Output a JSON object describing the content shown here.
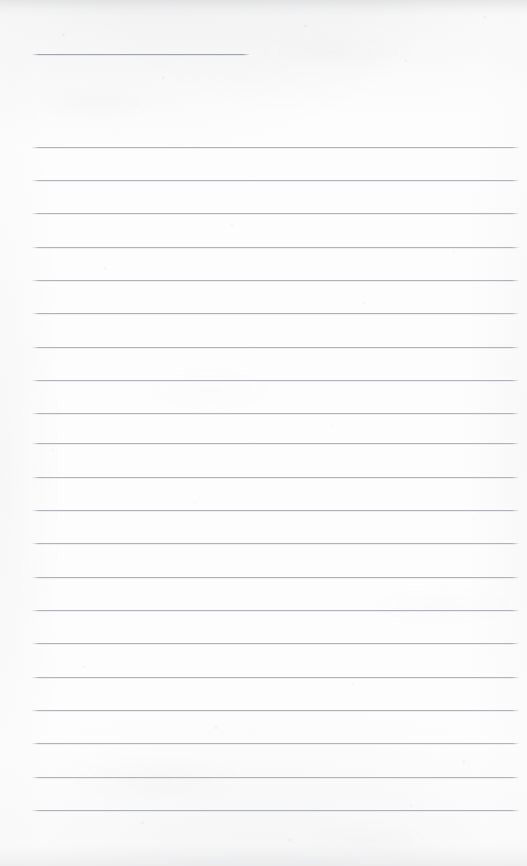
{
  "document": {
    "kind": "scanned-ruled-notepad-page",
    "description": "Blank lined notebook page, scanned",
    "page_width": 527,
    "page_height": 866,
    "paper_color": "#fdfdfd",
    "rule_color": "#acb0b5",
    "content_text": "",
    "handwriting_present": false
  },
  "layout": {
    "rule_left_x": 31,
    "rule_right_x": 520,
    "rule_thickness": 2,
    "line_spacing": 33.3,
    "title_rule_right_x": 251
  },
  "rules": [
    {
      "id": "title-rule",
      "label": "title-line",
      "y": 54,
      "x": 31,
      "width": 220,
      "title": true
    },
    {
      "id": "rule-1",
      "label": "ruled-line-1",
      "y": 147,
      "x": 31,
      "width": 489,
      "title": false
    },
    {
      "id": "rule-2",
      "label": "ruled-line-2",
      "y": 180,
      "x": 31,
      "width": 489,
      "title": false
    },
    {
      "id": "rule-3",
      "label": "ruled-line-3",
      "y": 213,
      "x": 31,
      "width": 489,
      "title": false
    },
    {
      "id": "rule-4",
      "label": "ruled-line-4",
      "y": 247,
      "x": 31,
      "width": 489,
      "title": false
    },
    {
      "id": "rule-5",
      "label": "ruled-line-5",
      "y": 280,
      "x": 31,
      "width": 489,
      "title": false
    },
    {
      "id": "rule-6",
      "label": "ruled-line-6",
      "y": 313,
      "x": 31,
      "width": 489,
      "title": false
    },
    {
      "id": "rule-7",
      "label": "ruled-line-7",
      "y": 347,
      "x": 31,
      "width": 489,
      "title": false
    },
    {
      "id": "rule-8",
      "label": "ruled-line-8",
      "y": 380,
      "x": 31,
      "width": 489,
      "title": false
    },
    {
      "id": "rule-9",
      "label": "ruled-line-9",
      "y": 413,
      "x": 31,
      "width": 489,
      "title": false
    },
    {
      "id": "rule-10",
      "label": "ruled-line-10",
      "y": 443,
      "x": 31,
      "width": 489,
      "title": false
    },
    {
      "id": "rule-11",
      "label": "ruled-line-11",
      "y": 477,
      "x": 31,
      "width": 489,
      "title": false
    },
    {
      "id": "rule-12",
      "label": "ruled-line-12",
      "y": 510,
      "x": 31,
      "width": 489,
      "title": false
    },
    {
      "id": "rule-13",
      "label": "ruled-line-13",
      "y": 543,
      "x": 31,
      "width": 489,
      "title": false
    },
    {
      "id": "rule-14",
      "label": "ruled-line-14",
      "y": 577,
      "x": 31,
      "width": 489,
      "title": false
    },
    {
      "id": "rule-15",
      "label": "ruled-line-15",
      "y": 610,
      "x": 31,
      "width": 489,
      "title": false
    },
    {
      "id": "rule-16",
      "label": "ruled-line-16",
      "y": 643,
      "x": 31,
      "width": 489,
      "title": false
    },
    {
      "id": "rule-17",
      "label": "ruled-line-17",
      "y": 677,
      "x": 31,
      "width": 489,
      "title": false
    },
    {
      "id": "rule-18",
      "label": "ruled-line-18",
      "y": 710,
      "x": 31,
      "width": 489,
      "title": false
    },
    {
      "id": "rule-19",
      "label": "ruled-line-19",
      "y": 743,
      "x": 31,
      "width": 489,
      "title": false
    },
    {
      "id": "rule-20",
      "label": "ruled-line-20",
      "y": 777,
      "x": 31,
      "width": 489,
      "title": false
    },
    {
      "id": "rule-21",
      "label": "ruled-line-21",
      "y": 810,
      "x": 31,
      "width": 489,
      "title": false
    }
  ]
}
